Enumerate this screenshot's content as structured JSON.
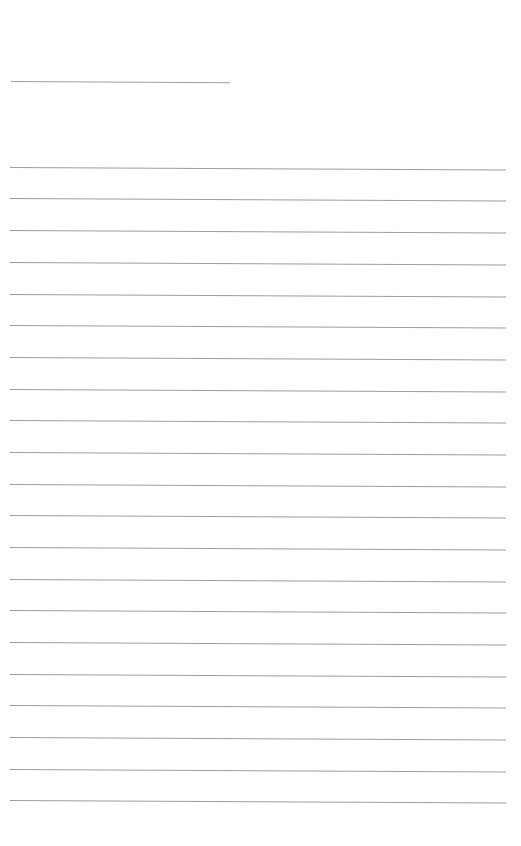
{
  "document": {
    "type": "blank-ruled-page",
    "background_color": "#ffffff",
    "line_color": "#8c8c8c",
    "header_line": {
      "x1": 11,
      "x2": 230,
      "y": 81,
      "tilt_deg": 0.3
    },
    "ruled_lines": {
      "x1": 10,
      "x2": 506,
      "tilt_deg": 0.3,
      "y_positions": [
        167,
        198,
        230,
        262,
        294,
        325,
        357,
        389,
        420,
        452,
        484,
        515,
        547,
        579,
        610,
        642,
        674,
        705,
        737,
        769,
        800
      ]
    }
  }
}
